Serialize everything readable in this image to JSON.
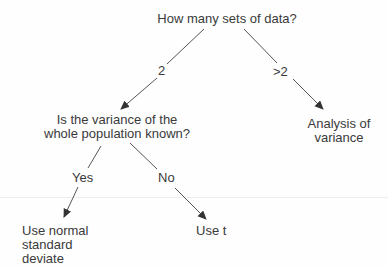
{
  "diagram": {
    "type": "decision-tree",
    "nodes": {
      "root": {
        "lines": [
          "How many sets of data?"
        ]
      },
      "variance_question": {
        "lines": [
          "Is the variance of the",
          "whole population known?"
        ]
      },
      "anova": {
        "lines": [
          "Analysis of",
          "variance"
        ]
      },
      "normal": {
        "lines": [
          "Use normal",
          "standard",
          "deviate"
        ]
      },
      "t_test": {
        "lines": [
          "Use t"
        ]
      }
    },
    "edges": [
      {
        "from": "root",
        "to": "variance_question",
        "label": "2"
      },
      {
        "from": "root",
        "to": "anova",
        "label": ">2"
      },
      {
        "from": "variance_question",
        "to": "normal",
        "label": "Yes"
      },
      {
        "from": "variance_question",
        "to": "t_test",
        "label": "No"
      }
    ],
    "colors": {
      "line": "#444444",
      "text": "#3a3a3a",
      "background": "#fefefe"
    }
  }
}
